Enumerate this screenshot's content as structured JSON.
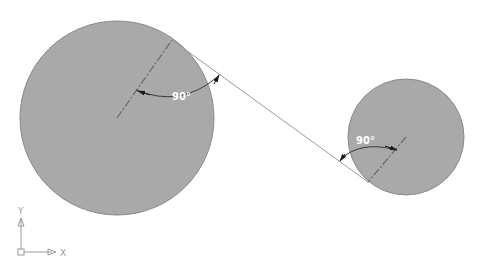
{
  "drawing": {
    "type": "CAD tangent-line construction",
    "background_color": "#ffffff",
    "circles": [
      {
        "id": "large",
        "cx": 117,
        "cy": 118,
        "r": 97,
        "fill": "#a9a9a9",
        "stroke": "#8a8a8a"
      },
      {
        "id": "small",
        "cx": 406,
        "cy": 137,
        "r": 58,
        "fill": "#a9a9a9",
        "stroke": "#8a8a8a"
      }
    ],
    "tangent_line": {
      "x1": 172,
      "y1": 40,
      "x2": 368,
      "y2": 182,
      "color": "#9a9a9a"
    },
    "dimensions": [
      {
        "label": "90°",
        "circle": "large",
        "text_x": 171,
        "text_y": 99
      },
      {
        "label": "90°",
        "circle": "small",
        "text_x": 355,
        "text_y": 144
      }
    ]
  },
  "ucs_icon": {
    "x_label": "X",
    "y_label": "Y"
  }
}
